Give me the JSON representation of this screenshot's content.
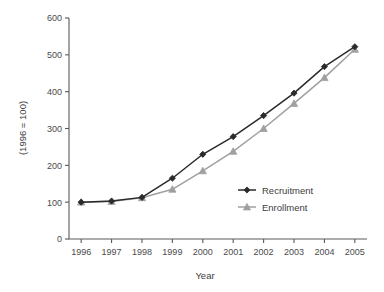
{
  "chart_data": {
    "type": "line",
    "title": "",
    "xlabel": "Year",
    "ylabel": "(1996 = 100)",
    "categories": [
      "1996",
      "1997",
      "1998",
      "1999",
      "2000",
      "2001",
      "2002",
      "2003",
      "2004",
      "2005"
    ],
    "x": [
      1996,
      1997,
      1998,
      1999,
      2000,
      2001,
      2002,
      2003,
      2004,
      2005
    ],
    "xlim": [
      1995.6,
      2005.4
    ],
    "ylim": [
      0,
      600
    ],
    "yticks": [
      0,
      100,
      200,
      300,
      400,
      500,
      600
    ],
    "ytick_labels": [
      "0",
      "100",
      "200",
      "300",
      "400",
      "500",
      "600"
    ],
    "grid": false,
    "legend_position": "center-right",
    "series": [
      {
        "name": "Recruitment",
        "color": "#2b2b2b",
        "marker": "diamond",
        "values": [
          100,
          103,
          113,
          165,
          230,
          278,
          335,
          396,
          468,
          522
        ]
      },
      {
        "name": "Enrollment",
        "color": "#a0a0a0",
        "marker": "triangle",
        "values": [
          100,
          102,
          112,
          135,
          185,
          238,
          300,
          368,
          438,
          515
        ]
      }
    ]
  },
  "legend": {
    "items": [
      {
        "label": "Recruitment"
      },
      {
        "label": "Enrollment"
      }
    ]
  },
  "colors": {
    "recruitment": "#2b2b2b",
    "enrollment": "#a0a0a0",
    "axis": "#5a5a5a",
    "text": "#3d3d3d",
    "background": "#ffffff"
  }
}
